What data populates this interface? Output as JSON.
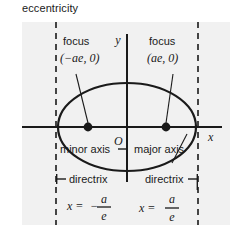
{
  "caption": {
    "text": "eccentricity"
  },
  "figure": {
    "background_color": "#f1f1f1",
    "ink_color": "#1a1a1a",
    "axes": {
      "x_label": "x",
      "y_label": "y",
      "origin_label": "O"
    },
    "foci": {
      "left": {
        "title": "focus",
        "coords": "(−ae, 0)"
      },
      "right": {
        "title": "focus",
        "coords": "(ae, 0)"
      }
    },
    "axis_labels": {
      "minor": "minor axis",
      "major": "major axis"
    },
    "directrices": {
      "left": {
        "title": "directrix",
        "equation_lhs": "x =",
        "equation_sign": "−",
        "numerator": "a",
        "denominator": "e"
      },
      "right": {
        "title": "directrix",
        "equation_lhs": "x =",
        "equation_sign": "",
        "numerator": "a",
        "denominator": "e"
      }
    }
  }
}
